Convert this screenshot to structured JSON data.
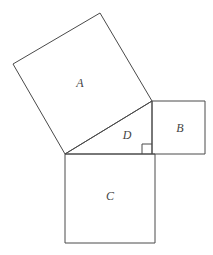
{
  "figure": {
    "background_color": "#ffffff",
    "stroke_color": "#4a4a4a",
    "label_color": "#444444",
    "canvas": {
      "width": 213,
      "height": 255
    }
  },
  "chart_data": {
    "type": "diagram",
    "grid": false,
    "legend": false,
    "shapes": [
      {
        "id": "square-a",
        "label": "A",
        "kind": "square",
        "on_side": "hypotenuse",
        "points": "65,154 13,64 100,13 152,101",
        "label_position": {
          "x": 80,
          "y": 83
        }
      },
      {
        "id": "square-b",
        "label": "B",
        "kind": "square",
        "on_side": "vertical-leg",
        "points": "152,101 205,101 205,154 152,154",
        "label_position": {
          "x": 180,
          "y": 128
        }
      },
      {
        "id": "square-c",
        "label": "C",
        "kind": "square",
        "on_side": "horizontal-leg",
        "points": "65,154 155,154 155,243 65,243",
        "label_position": {
          "x": 110,
          "y": 196
        }
      },
      {
        "id": "triangle-d",
        "label": "D",
        "kind": "right-triangle",
        "points": "65,154 152,101 152,154",
        "label_position": {
          "x": 127,
          "y": 135
        }
      }
    ],
    "right_angle_marker": {
      "vertex": {
        "x": 152,
        "y": 154
      },
      "points": "142,154 142,144 152,144",
      "size": 10
    }
  },
  "labels": {
    "a": "A",
    "b": "B",
    "c": "C",
    "d": "D"
  }
}
